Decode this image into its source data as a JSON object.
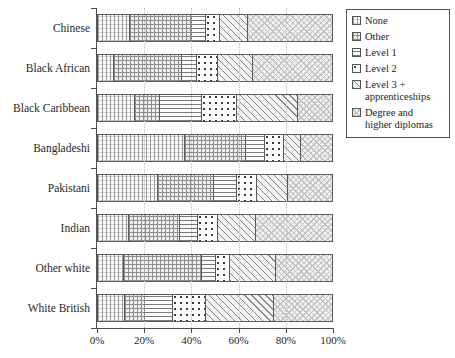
{
  "chart_data": {
    "type": "bar",
    "orientation": "horizontal",
    "stacked": true,
    "normalized_percent": true,
    "title": "",
    "xlabel": "",
    "ylabel": "",
    "xlim": [
      0,
      100
    ],
    "grid": true,
    "legend_position": "right",
    "categories": [
      "Chinese",
      "Black African",
      "Black Caribbean",
      "Bangladeshi",
      "Pakistani",
      "Indian",
      "Other white",
      "White British"
    ],
    "xticks": [
      "0%",
      "20%",
      "40%",
      "60%",
      "80%",
      "100%"
    ],
    "xtick_values": [
      0,
      20,
      40,
      60,
      80,
      100
    ],
    "series": [
      {
        "name": "None",
        "pattern": "fine-grid",
        "values": [
          13.5,
          6.8,
          15.8,
          37.3,
          25.7,
          13.3,
          11.1,
          11.6
        ]
      },
      {
        "name": "Other",
        "pattern": "cross-hatch",
        "values": [
          26.8,
          29.3,
          10.9,
          25.8,
          23.9,
          21.9,
          33.3,
          8.4
        ]
      },
      {
        "name": "Level 1",
        "pattern": "horizontal-lines",
        "values": [
          5.8,
          6.4,
          17.7,
          8.1,
          9.6,
          7.7,
          5.9,
          11.9
        ]
      },
      {
        "name": "Level 2",
        "pattern": "polka-dots",
        "values": [
          5.9,
          8.9,
          15.2,
          8.5,
          8.7,
          8.2,
          6.1,
          14.2
        ]
      },
      {
        "name": "Level 3 + apprenticeships",
        "pattern": "diagonal-hatch",
        "values": [
          12.1,
          14.8,
          26.0,
          7.0,
          13.2,
          16.6,
          19.7,
          29.3
        ]
      },
      {
        "name": "Degree and higher diplomas",
        "pattern": "light-crosshatch",
        "values": [
          35.9,
          33.8,
          14.4,
          13.3,
          18.9,
          32.3,
          23.9,
          24.6
        ]
      }
    ]
  },
  "legend": {
    "items": [
      {
        "label": "None",
        "pattern": "fine-grid"
      },
      {
        "label": "Other",
        "pattern": "cross-hatch"
      },
      {
        "label": "Level 1",
        "pattern": "horizontal-lines"
      },
      {
        "label": "Level 2",
        "pattern": "polka-dots"
      },
      {
        "label": "Level 3 +\napprenticeships",
        "pattern": "diagonal-hatch"
      },
      {
        "label": "Degree and\nhigher diplomas",
        "pattern": "light-crosshatch"
      }
    ]
  },
  "colors": {
    "axis": "#4d4d4d",
    "text": "#272727",
    "gridline": "#bdbdbd",
    "bar_border": "#5a5a5a",
    "background": "#ffffff"
  }
}
